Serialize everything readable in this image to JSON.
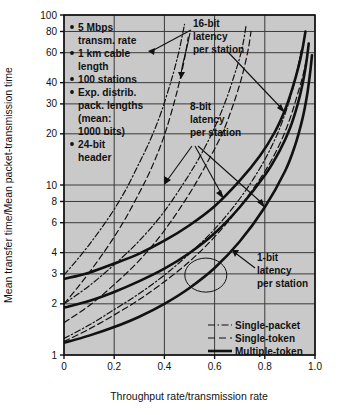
{
  "chart_data": {
    "type": "line",
    "title": "",
    "xlabel": "Throughput rate/transmission rate",
    "ylabel": "Mean transfer time/Mean packet-transmission time",
    "xlim": [
      0,
      1.0
    ],
    "ylim": [
      1,
      100
    ],
    "yscale": "log",
    "grid": true,
    "xticks": [
      "0",
      "0.2",
      "0.4",
      "0.6",
      "0.8",
      "1.0"
    ],
    "xtick_values": [
      0,
      0.2,
      0.4,
      0.6,
      0.8,
      1.0
    ],
    "yticks": [
      "1",
      "2",
      "3",
      "4",
      "6",
      "8",
      "10",
      "20",
      "30",
      "40",
      "60",
      "80",
      "100"
    ],
    "ytick_values": [
      1,
      2,
      3,
      4,
      6,
      8,
      10,
      20,
      30,
      40,
      60,
      80,
      100
    ],
    "legend_position": "bottom-right",
    "legend": [
      {
        "label": "Single-packet",
        "style": "dash-dot"
      },
      {
        "label": "Single-token",
        "style": "dashed"
      },
      {
        "label": "Multiple-token",
        "style": "solid"
      }
    ],
    "annotations": [
      {
        "label": "16-bit latency per station",
        "lines": [
          "16-bit",
          "latency",
          "per station"
        ]
      },
      {
        "label": "8-bit latency per station",
        "lines": [
          "8-bit",
          "latency",
          "per station"
        ]
      },
      {
        "label": "1-bit latency per station",
        "lines": [
          "1-bit",
          "latency",
          "per station"
        ]
      }
    ],
    "parameters": [
      "5 Mbps transm. rate",
      "1 km cable length",
      "100 stations",
      "Exp. distrib. pack. lengths (mean: 1000 bits)",
      "24-bit header"
    ],
    "series": [
      {
        "name": "Single-packet, 16-bit latency",
        "style": "dash-dot",
        "latency_bits": 16,
        "x": [
          0.0,
          0.05,
          0.1,
          0.15,
          0.2,
          0.25,
          0.3,
          0.33,
          0.36,
          0.39,
          0.42,
          0.44,
          0.46,
          0.48
        ],
        "y": [
          2.95,
          3.6,
          4.45,
          5.6,
          7.2,
          9.6,
          13.5,
          16.6,
          21.0,
          27.5,
          38.0,
          48.0,
          63.0,
          88.0
        ]
      },
      {
        "name": "Single-token, 16-bit latency",
        "style": "dashed",
        "latency_bits": 16,
        "x": [
          0.0,
          0.05,
          0.1,
          0.15,
          0.2,
          0.25,
          0.3,
          0.34,
          0.38,
          0.41,
          0.44,
          0.46,
          0.48,
          0.495
        ],
        "y": [
          2.0,
          2.45,
          3.05,
          3.85,
          4.95,
          6.55,
          9.0,
          11.8,
          16.3,
          21.8,
          31.0,
          40.5,
          55.0,
          74.0
        ]
      },
      {
        "name": "Single-packet, 8-bit latency",
        "style": "dash-dot",
        "latency_bits": 8,
        "x": [
          0.0,
          0.1,
          0.2,
          0.3,
          0.4,
          0.5,
          0.56,
          0.61,
          0.65,
          0.68,
          0.7,
          0.715,
          0.725
        ],
        "y": [
          2.0,
          2.55,
          3.4,
          4.7,
          7.0,
          11.6,
          16.5,
          23.5,
          33.0,
          45.0,
          56.0,
          70.0,
          86.0
        ]
      },
      {
        "name": "Single-token, 8-bit latency",
        "style": "dashed",
        "latency_bits": 8,
        "x": [
          0.0,
          0.1,
          0.2,
          0.3,
          0.4,
          0.5,
          0.57,
          0.63,
          0.67,
          0.7,
          0.72,
          0.735,
          0.745
        ],
        "y": [
          1.55,
          1.95,
          2.6,
          3.6,
          5.4,
          8.9,
          13.5,
          20.0,
          28.5,
          39.0,
          50.5,
          64.0,
          80.0
        ]
      },
      {
        "name": "Single-packet, 1-bit latency",
        "style": "dash-dot",
        "latency_bits": 1,
        "x": [
          0.0,
          0.1,
          0.2,
          0.3,
          0.4,
          0.5,
          0.6,
          0.7,
          0.78,
          0.84,
          0.88,
          0.91,
          0.93,
          0.945
        ],
        "y": [
          1.25,
          1.5,
          1.85,
          2.3,
          2.95,
          3.95,
          5.5,
          8.3,
          12.5,
          18.5,
          26.0,
          36.0,
          48.0,
          62.0
        ]
      },
      {
        "name": "Single-token, 1-bit latency",
        "style": "dashed",
        "latency_bits": 1,
        "x": [
          0.0,
          0.1,
          0.2,
          0.3,
          0.4,
          0.5,
          0.6,
          0.7,
          0.8,
          0.86,
          0.9,
          0.93,
          0.955,
          0.97
        ],
        "y": [
          1.2,
          1.42,
          1.72,
          2.12,
          2.7,
          3.55,
          4.95,
          7.4,
          12.0,
          17.5,
          24.5,
          34.0,
          46.0,
          60.0
        ]
      },
      {
        "name": "Multiple-token, 16-bit latency",
        "style": "solid",
        "latency_bits": 16,
        "x": [
          0.0,
          0.1,
          0.2,
          0.3,
          0.4,
          0.5,
          0.6,
          0.7,
          0.78,
          0.84,
          0.88,
          0.91,
          0.935,
          0.95,
          0.962
        ],
        "y": [
          2.8,
          3.05,
          3.45,
          3.95,
          4.7,
          5.8,
          7.5,
          10.6,
          14.8,
          20.5,
          27.5,
          37.0,
          50.0,
          63.0,
          80.0
        ]
      },
      {
        "name": "Multiple-token, 8-bit latency",
        "style": "solid",
        "latency_bits": 8,
        "x": [
          0.0,
          0.1,
          0.2,
          0.3,
          0.4,
          0.5,
          0.6,
          0.7,
          0.8,
          0.86,
          0.9,
          0.93,
          0.95,
          0.965,
          0.975
        ],
        "y": [
          1.9,
          2.08,
          2.35,
          2.72,
          3.22,
          3.98,
          5.2,
          7.4,
          11.4,
          16.0,
          21.5,
          29.5,
          39.0,
          52.0,
          68.0
        ]
      },
      {
        "name": "Multiple-token, 1-bit latency",
        "style": "solid",
        "latency_bits": 1,
        "x": [
          0.0,
          0.1,
          0.2,
          0.3,
          0.4,
          0.5,
          0.6,
          0.7,
          0.8,
          0.88,
          0.92,
          0.95,
          0.968,
          0.98,
          0.988
        ],
        "y": [
          1.18,
          1.3,
          1.46,
          1.68,
          2.0,
          2.48,
          3.25,
          4.65,
          7.4,
          12.0,
          17.0,
          24.5,
          33.5,
          45.0,
          58.0
        ]
      }
    ],
    "circle_highlight": {
      "x": 0.565,
      "y": 2.95
    }
  },
  "notes": {
    "b1": "5 Mbps",
    "b1b": "transm. rate",
    "b2": "1 km cable",
    "b2b": "length",
    "b3": "100 stations",
    "b4": "Exp. distrib.",
    "b4b": "pack. lengths",
    "b4c": "(mean:",
    "b4d": "1000 bits)",
    "b5": "24-bit",
    "b5b": "header"
  },
  "anno16": {
    "l1": "16-bit",
    "l2": "latency",
    "l3": "per station"
  },
  "anno8": {
    "l1": "8-bit",
    "l2": "latency",
    "l3": "per station"
  },
  "anno1": {
    "l1": "1-bit",
    "l2": "latency",
    "l3": "per station"
  },
  "legend": {
    "a": "Single-packet",
    "b": "Single-token",
    "c": "Multiple-token"
  },
  "axes": {
    "x_title": "Throughput rate/transmission rate",
    "y_title": "Mean transfer time/Mean packet-transmission time"
  },
  "colors": {
    "plot_bg": "#c9c9c9",
    "grid": "#3a3a3a",
    "ink": "#111111",
    "page_bg": "#ffffff"
  }
}
